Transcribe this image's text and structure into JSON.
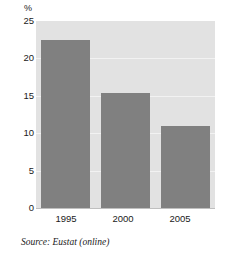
{
  "chart_data": {
    "type": "bar",
    "title": "",
    "xlabel": "",
    "ylabel": "%",
    "categories": [
      "1995",
      "2000",
      "2005"
    ],
    "values": [
      22.5,
      15.4,
      11.0
    ],
    "ylim": [
      0,
      25
    ],
    "yticks": [
      "0",
      "5",
      "10",
      "15",
      "20",
      "25"
    ],
    "ytick_values": [
      0,
      5,
      10,
      15,
      20,
      25
    ],
    "grid": true,
    "legend": "none",
    "bar_color": "#808080",
    "plot_background": "#e2e2e2",
    "gridline_color": "#f2f2f2"
  },
  "caption": {
    "source": "Source: Eustat (online)"
  }
}
